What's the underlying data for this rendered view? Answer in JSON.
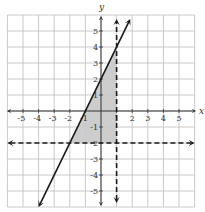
{
  "chart_data": {
    "type": "line",
    "title": "",
    "xlabel": "x",
    "ylabel": "y",
    "xlim": [
      -6,
      6
    ],
    "ylim": [
      -6,
      6
    ],
    "grid": true,
    "x_ticks": [
      -5,
      -4,
      -3,
      -2,
      -1,
      1,
      2,
      3,
      4,
      5
    ],
    "y_ticks": [
      5,
      4,
      3,
      2,
      1,
      -1,
      -2,
      -3,
      -4,
      -5
    ],
    "x_tick_labels": [
      "-5",
      "-4",
      "-3",
      "-2",
      "-1",
      "1",
      "2",
      "3",
      "4",
      "5"
    ],
    "y_tick_labels": [
      "5",
      "4",
      "3",
      "2",
      "1",
      "-1",
      "-2",
      "-3",
      "-4",
      "-5"
    ],
    "series": [
      {
        "name": "y = 2x + 2",
        "style": "solid",
        "equation": "y = 2x + 2",
        "points": [
          [
            -4,
            -6
          ],
          [
            1.875,
            5.75
          ]
        ],
        "arrows": "both"
      },
      {
        "name": "x = 1",
        "style": "dashed",
        "equation": "x = 1",
        "points": [
          [
            1,
            -5.75
          ],
          [
            1,
            5.75
          ]
        ],
        "arrows": "both"
      },
      {
        "name": "y = -2",
        "style": "dashed",
        "equation": "y = -2",
        "points": [
          [
            -6,
            -2
          ],
          [
            6,
            -2
          ]
        ],
        "arrows": "both"
      }
    ],
    "shaded_region": {
      "description": "Feasible region: y <= 2x + 2, x < 1, y > -2",
      "vertices": [
        [
          -2,
          -2
        ],
        [
          1,
          -2
        ],
        [
          1,
          4
        ]
      ],
      "color": "#c8c8c8"
    }
  },
  "colors": {
    "grid": "#bdbdbd",
    "axis": "#333333",
    "line": "#1a1a1a",
    "shade": "#c8c8c8"
  },
  "axes": {
    "x_label": "x",
    "y_label": "y"
  }
}
